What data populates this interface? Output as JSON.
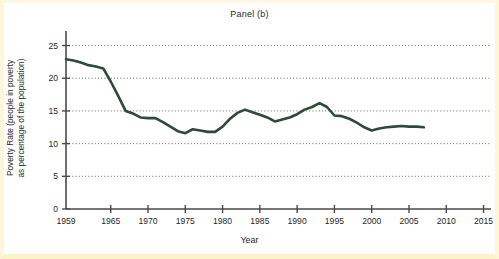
{
  "chart_data": {
    "type": "line",
    "title": "Panel (b)",
    "xlabel": "Year",
    "ylabel": "Poverty Rate (people in poverty as percentage of the population)",
    "ylabel_line1": "Poverty Rate (people in poverty",
    "ylabel_line2": "as percentage of the population)",
    "grid": true,
    "legend": "none",
    "xlim": [
      1959,
      2016
    ],
    "ylim": [
      0,
      26
    ],
    "xticks": [
      1959,
      1965,
      1970,
      1975,
      1980,
      1985,
      1990,
      1995,
      2000,
      2005,
      2010,
      2015
    ],
    "xtick_labels": [
      "1959",
      "1965",
      "1970",
      "1975",
      "1980",
      "1985",
      "1990",
      "1995",
      "2000",
      "2005",
      "2010",
      "2015"
    ],
    "yticks": [
      0,
      5,
      10,
      15,
      20,
      25
    ],
    "ytick_labels": [
      "0",
      "5",
      "10",
      "15",
      "20",
      "25"
    ],
    "line_color": "#2e4a39",
    "series_name": "Poverty Rate",
    "x": [
      1959,
      1960,
      1961,
      1962,
      1963,
      1964,
      1965,
      1966,
      1967,
      1968,
      1969,
      1970,
      1971,
      1972,
      1973,
      1974,
      1975,
      1976,
      1977,
      1978,
      1979,
      1980,
      1981,
      1982,
      1983,
      1984,
      1985,
      1986,
      1987,
      1988,
      1989,
      1990,
      1991,
      1992,
      1993,
      1994,
      1995,
      1996,
      1997,
      1998,
      1999,
      2000,
      2001,
      2002,
      2003,
      2004,
      2005,
      2006,
      2007
    ],
    "values": [
      22.9,
      22.7,
      22.4,
      22.0,
      21.8,
      21.5,
      19.5,
      17.3,
      15.0,
      14.6,
      14.0,
      13.9,
      13.9,
      13.3,
      12.6,
      11.9,
      11.6,
      12.2,
      12.0,
      11.8,
      11.8,
      12.6,
      13.8,
      14.7,
      15.2,
      14.8,
      14.4,
      14.0,
      13.4,
      13.7,
      14.0,
      14.5,
      15.2,
      15.6,
      16.2,
      15.6,
      14.3,
      14.2,
      13.8,
      13.2,
      12.5,
      12.0,
      12.3,
      12.5,
      12.6,
      12.7,
      12.6,
      12.6,
      12.5
    ]
  }
}
